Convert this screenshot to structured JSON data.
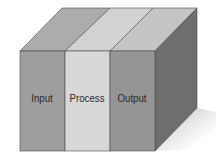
{
  "diagram": {
    "type": "3d-block",
    "columns": [
      {
        "label": "Input",
        "front_color": "#9e9e9e",
        "top_color": "#acacac"
      },
      {
        "label": "Process",
        "front_color": "#d8d8d8",
        "top_color": "#d2d2d2"
      },
      {
        "label": "Output",
        "front_color": "#959595",
        "top_color": "#c4c4c4"
      }
    ],
    "side_color": "#6e6e6e",
    "shadow_color": "#c8c8c8",
    "edge_color": "#4a4a4a"
  }
}
